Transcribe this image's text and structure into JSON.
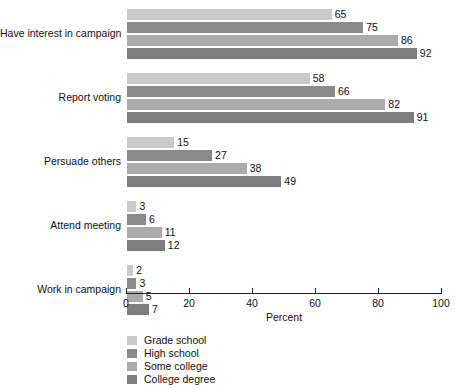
{
  "chart_data": {
    "type": "bar",
    "orientation": "horizontal",
    "title": "",
    "xlabel": "Percent",
    "ylabel": "",
    "xlim": [
      0,
      100
    ],
    "xticks": [
      0,
      20,
      40,
      60,
      80,
      100
    ],
    "xtick_labels": [
      "0",
      "20",
      "40",
      "60",
      "80",
      "100"
    ],
    "grid": false,
    "legend_position": "bottom-left",
    "categories": [
      "Have interest in campaign",
      "Report voting",
      "Persuade others",
      "Attend meeting",
      "Work in campaign"
    ],
    "series": [
      {
        "name": "Grade school",
        "color": "#c9c9c9",
        "values": [
          65,
          58,
          15,
          3,
          2
        ]
      },
      {
        "name": "High school",
        "color": "#8a8a8a",
        "values": [
          75,
          66,
          27,
          6,
          3
        ]
      },
      {
        "name": "Some college",
        "color": "#ababab",
        "values": [
          86,
          82,
          38,
          11,
          5
        ]
      },
      {
        "name": "College degree",
        "color": "#7e7e7e",
        "values": [
          92,
          91,
          49,
          12,
          7
        ]
      }
    ]
  },
  "axis": {
    "x_title": "Percent",
    "ticks": [
      {
        "label": "0"
      },
      {
        "label": "20"
      },
      {
        "label": "40"
      },
      {
        "label": "60"
      },
      {
        "label": "80"
      },
      {
        "label": "100"
      }
    ]
  },
  "legend": {
    "items": [
      {
        "label": "Grade school"
      },
      {
        "label": "High school"
      },
      {
        "label": "Some college"
      },
      {
        "label": "College degree"
      }
    ]
  }
}
